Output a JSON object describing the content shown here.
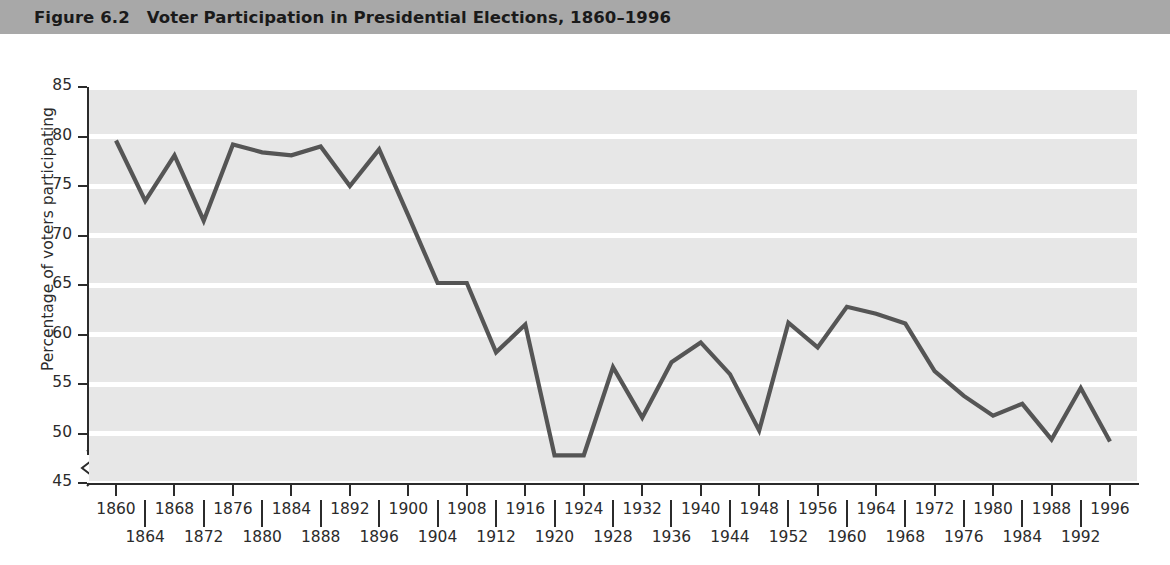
{
  "header": {
    "figure_number": "Figure 6.2",
    "title": "Voter Participation in Presidential Elections, 1860–1996",
    "bg_color": "#a8a8a8",
    "text_color": "#1a1a1a"
  },
  "style": {
    "plot_band_color": "#e7e7e7",
    "gridline_color": "#ffffff",
    "line_color": "#555555",
    "axis_color": "#2b2b2b",
    "page_bg": "#ffffff"
  },
  "chart_data": {
    "type": "line",
    "title": "Voter Participation in Presidential Elections, 1860–1996",
    "xlabel": "",
    "ylabel": "Percentage of voters participating",
    "xlim": [
      1860,
      1996
    ],
    "ylim": [
      45,
      85
    ],
    "yticks": [
      45,
      50,
      55,
      60,
      65,
      70,
      75,
      80,
      85
    ],
    "ytick_labels": [
      "45",
      "50",
      "55",
      "60",
      "65",
      "70",
      "75",
      "80",
      "85"
    ],
    "y_axis_break": true,
    "grid": "horizontal-white-on-gray-bands",
    "legend": "none",
    "x_labels_top": [
      "1860",
      "1868",
      "1876",
      "1884",
      "1892",
      "1900",
      "1908",
      "1916",
      "1924",
      "1932",
      "1940",
      "1948",
      "1956",
      "1964",
      "1972",
      "1980",
      "1988",
      "1996"
    ],
    "x_labels_bottom": [
      "1864",
      "1872",
      "1880",
      "1888",
      "1896",
      "1904",
      "1912",
      "1920",
      "1928",
      "1936",
      "1944",
      "1952",
      "1960",
      "1968",
      "1976",
      "1984",
      "1992"
    ],
    "x": [
      1860,
      1864,
      1868,
      1872,
      1876,
      1880,
      1884,
      1888,
      1892,
      1896,
      1900,
      1904,
      1908,
      1912,
      1916,
      1920,
      1924,
      1928,
      1932,
      1936,
      1940,
      1944,
      1948,
      1952,
      1956,
      1960,
      1964,
      1968,
      1972,
      1976,
      1980,
      1984,
      1988,
      1992,
      1996
    ],
    "values": [
      79.6,
      73.5,
      78.1,
      71.5,
      79.2,
      78.4,
      78.1,
      79.0,
      75.0,
      78.7,
      72.0,
      65.2,
      65.2,
      58.2,
      61.0,
      47.8,
      47.8,
      56.7,
      51.6,
      57.2,
      59.2,
      56.0,
      50.3,
      61.2,
      58.7,
      62.8,
      62.1,
      61.1,
      56.3,
      53.8,
      51.8,
      53.0,
      49.4,
      54.6,
      49.2
    ],
    "series_name": "Percentage of voters participating"
  }
}
